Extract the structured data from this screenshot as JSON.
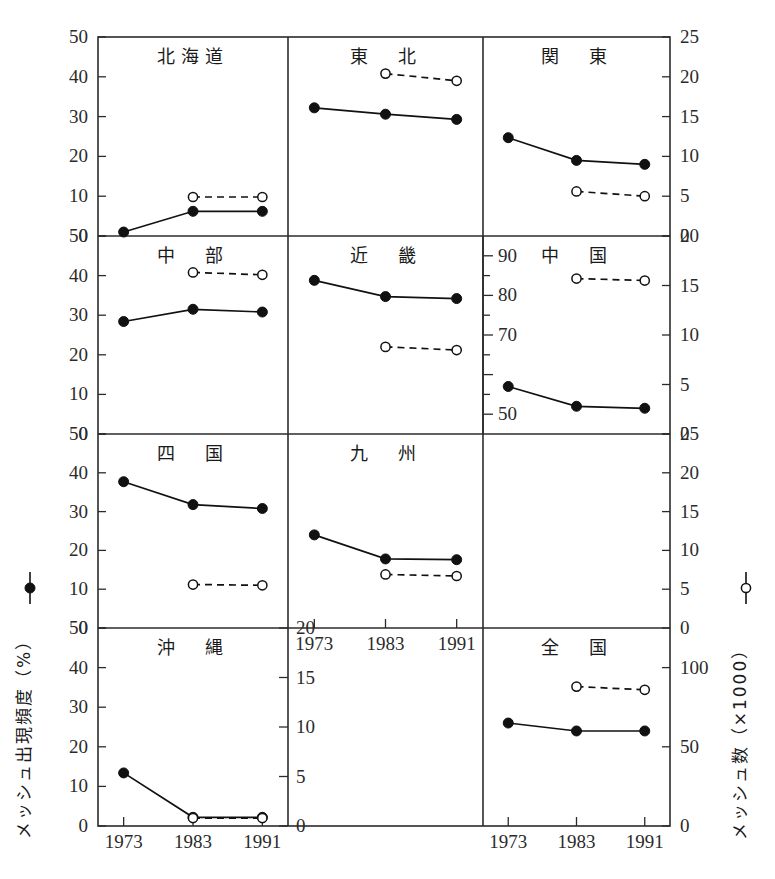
{
  "figure": {
    "left_axis_label": "メッシュ出現頻度（%）",
    "left_axis_legend_symbol": "—●—",
    "right_axis_label": "メッシュ数（×1000）",
    "right_axis_legend_symbol": "—○—",
    "x_categories": [
      "1973",
      "1983",
      "1991"
    ]
  },
  "axes": {
    "left_ticks_pct": [
      "0",
      "10",
      "20",
      "30",
      "40",
      "50"
    ],
    "right_ticks_thousand": [
      "0",
      "5",
      "10",
      "15",
      "20",
      "25"
    ],
    "chugoku_left_ticks_pct": [
      "50",
      "60",
      "70",
      "80",
      "90"
    ],
    "okinawa_right_ticks_thousand": [
      "0",
      "5",
      "10",
      "15",
      "20"
    ],
    "zenkoku_right_ticks_thousand": [
      "0",
      "50",
      "100"
    ]
  },
  "chart_data": {
    "type": "line",
    "title": "",
    "xlabel": "",
    "ylabel": "メッシュ出現頻度（%）",
    "y2label": "メッシュ数（×1000）",
    "x": [
      "1973",
      "1983",
      "1991"
    ],
    "grid": false,
    "legend_position": "outside-left-and-right",
    "legend": [
      {
        "name": "メッシュ出現頻度（%）",
        "marker": "filled-circle",
        "line": "solid"
      },
      {
        "name": "メッシュ数（×1000）",
        "marker": "open-circle",
        "line": "dashed"
      }
    ],
    "panels": [
      {
        "name": "北海道",
        "row": 0,
        "col": 0,
        "ylim_pct": [
          0,
          50
        ],
        "y2lim_thousand": [
          0,
          25
        ],
        "series": [
          {
            "name": "メッシュ出現頻度（%）",
            "values": [
              1.0,
              6.2,
              6.2
            ],
            "axis": "left"
          },
          {
            "name": "メッシュ数（×1000）",
            "values": [
              null,
              4.9,
              4.9
            ],
            "axis": "right"
          }
        ]
      },
      {
        "name": "東　北",
        "row": 0,
        "col": 1,
        "ylim_pct": [
          0,
          50
        ],
        "y2lim_thousand": [
          0,
          25
        ],
        "series": [
          {
            "name": "メッシュ出現頻度（%）",
            "values": [
              32.2,
              30.6,
              29.3
            ],
            "axis": "left"
          },
          {
            "name": "メッシュ数（×1000）",
            "values": [
              null,
              20.4,
              19.5
            ],
            "axis": "right"
          }
        ]
      },
      {
        "name": "関　東",
        "row": 0,
        "col": 2,
        "ylim_pct": [
          0,
          50
        ],
        "y2lim_thousand": [
          0,
          25
        ],
        "series": [
          {
            "name": "メッシュ出現頻度（%）",
            "values": [
              24.7,
              19.0,
              18.0
            ],
            "axis": "left"
          },
          {
            "name": "メッシュ数（×1000）",
            "values": [
              null,
              5.6,
              5.0
            ],
            "axis": "right"
          }
        ]
      },
      {
        "name": "中　部",
        "row": 1,
        "col": 0,
        "ylim_pct": [
          0,
          50
        ],
        "y2lim_thousand": [
          0,
          25
        ],
        "series": [
          {
            "name": "メッシュ出現頻度（%）",
            "values": [
              28.4,
              31.5,
              30.8
            ],
            "axis": "left"
          },
          {
            "name": "メッシュ数（×1000）",
            "values": [
              null,
              20.4,
              20.1
            ],
            "axis": "right"
          }
        ]
      },
      {
        "name": "近　畿",
        "row": 1,
        "col": 1,
        "ylim_pct": [
          0,
          50
        ],
        "y2lim_thousand": [
          0,
          25
        ],
        "series": [
          {
            "name": "メッシュ出現頻度（%）",
            "values": [
              38.8,
              34.7,
              34.2
            ],
            "axis": "left"
          },
          {
            "name": "メッシュ数（×1000）",
            "values": [
              null,
              11.0,
              10.6
            ],
            "axis": "right"
          }
        ]
      },
      {
        "name": "中　国",
        "row": 1,
        "col": 2,
        "ylim_pct": [
          50,
          90
        ],
        "y2lim_thousand": [
          0,
          20
        ],
        "series": [
          {
            "name": "メッシュ出現頻度（%）",
            "values": [
              57.0,
              52.0,
              51.5
            ],
            "axis": "left-chugoku"
          },
          {
            "name": "メッシュ数（×1000）",
            "values": [
              null,
              15.7,
              15.5
            ],
            "axis": "right-chugoku"
          }
        ]
      },
      {
        "name": "四　国",
        "row": 2,
        "col": 0,
        "ylim_pct": [
          0,
          50
        ],
        "y2lim_thousand": [
          0,
          25
        ],
        "series": [
          {
            "name": "メッシュ出現頻度（%）",
            "values": [
              37.7,
              31.8,
              30.8
            ],
            "axis": "left"
          },
          {
            "name": "メッシュ数（×1000）",
            "values": [
              null,
              5.6,
              5.5
            ],
            "axis": "right"
          }
        ]
      },
      {
        "name": "九　州",
        "row": 2,
        "col": 1,
        "ylim_pct": [
          0,
          50
        ],
        "y2lim_thousand": [
          0,
          25
        ],
        "series": [
          {
            "name": "メッシュ出現頻度（%）",
            "values": [
              24.0,
              17.8,
              17.6
            ],
            "axis": "left"
          },
          {
            "name": "メッシュ数（×1000）",
            "values": [
              null,
              6.9,
              6.7
            ],
            "axis": "right"
          }
        ]
      },
      {
        "name": "沖　縄",
        "row": 3,
        "col": 0,
        "ylim_pct": [
          0,
          50
        ],
        "y2lim_thousand": [
          0,
          20
        ],
        "series": [
          {
            "name": "メッシュ出現頻度（%）",
            "values": [
              13.4,
              2.2,
              2.2
            ],
            "axis": "left"
          },
          {
            "name": "メッシュ数（×1000）",
            "values": [
              null,
              0.8,
              0.8
            ],
            "axis": "right-okinawa"
          }
        ]
      },
      {
        "name": "全　国",
        "row": 3,
        "col": 2,
        "ylim_pct": [
          0,
          50
        ],
        "y2lim_thousand": [
          0,
          125
        ],
        "series": [
          {
            "name": "メッシュ出現頻度（%）",
            "values": [
              26.0,
              24.0,
              24.0
            ],
            "axis": "left"
          },
          {
            "name": "メッシュ数（×1000）",
            "values": [
              null,
              88.0,
              86.0
            ],
            "axis": "right-zenkoku"
          }
        ]
      }
    ]
  }
}
